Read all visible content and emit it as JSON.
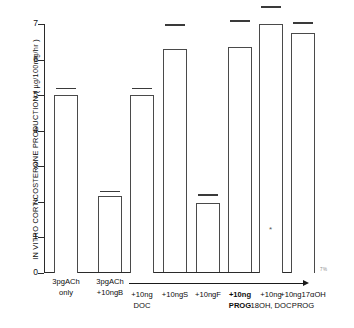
{
  "chart_data": {
    "type": "bar",
    "title": "",
    "xlabel": "",
    "ylabel": "IN VITRO CORTICOSTERONE PRODUCTION ( µg/100mg/hr )",
    "ylim": [
      0,
      7
    ],
    "yticks": [
      "0",
      "1",
      "2",
      "3",
      "4",
      "5",
      "6",
      "7"
    ],
    "grid": false,
    "legend": "none",
    "categories": [
      "3pgACh only",
      "3pgACh +10ngB",
      "+10ng DOC",
      "+10ngS",
      "+10ngF",
      "+10ng PROG",
      "+10ng 18OH, DOC",
      "+10ng17αOH PROG"
    ],
    "values": [
      5.0,
      2.15,
      5.0,
      6.3,
      1.95,
      6.35,
      7.0,
      6.75
    ],
    "error_cap_values": [
      5.2,
      2.3,
      5.2,
      7.0,
      2.2,
      7.1,
      7.5,
      7.05
    ],
    "annotations": [
      {
        "text": "*",
        "series_index": 6,
        "y": 1.2,
        "note": "asterisk inside seventh bar"
      }
    ]
  },
  "axis": {
    "y_title": "IN VITRO CORTICOSTERONE PRODUCTION ( µg/100mg/hr )",
    "y_ticks": [
      "7",
      "6",
      "5",
      "4",
      "3",
      "2",
      "1",
      "0"
    ]
  },
  "xaxis": {
    "labels": [
      {
        "line1": "3pgACh",
        "line2": "only",
        "bold": false
      },
      {
        "line1": "3pgACh",
        "line2": "+10ngB",
        "bold": false
      },
      {
        "line1": "+10ng",
        "line2": "DOC",
        "bold": false
      },
      {
        "line1": "+10ngS",
        "line2": "",
        "bold": false
      },
      {
        "line1": "+10ngF",
        "line2": "",
        "bold": false
      },
      {
        "line1": "+10ng",
        "line2": "PROG",
        "bold": true
      },
      {
        "line1": "+10ng",
        "line2": "18OH, DOC",
        "bold": false
      },
      {
        "line1": "+10ng17αOH",
        "line2": "PROG",
        "bold": false
      }
    ]
  },
  "marks": {
    "asterisk": "*",
    "corner_text": "7%"
  }
}
